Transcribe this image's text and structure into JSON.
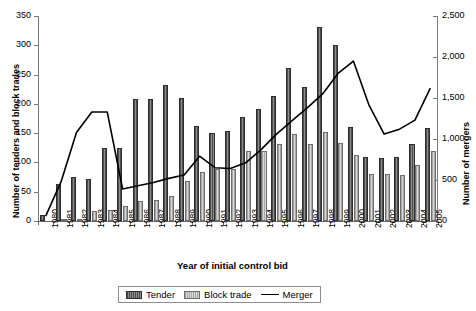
{
  "chart_data": {
    "type": "bar",
    "title": "",
    "xlabel": "Year of initial control bid",
    "ylabel": "Number of tenders and block trades",
    "ylabel_secondary": "Number of mergers",
    "ylim": [
      0,
      350
    ],
    "ylim_secondary": [
      0,
      2500
    ],
    "ytick_labels": [
      "0",
      "50",
      "100",
      "150",
      "200",
      "250",
      "300",
      "350"
    ],
    "ytick_values": [
      0,
      50,
      100,
      150,
      200,
      250,
      300,
      350
    ],
    "ytick_labels_secondary": [
      "0",
      "500",
      "1,000",
      "1,500",
      "2,000",
      "2,500"
    ],
    "ytick_values_secondary": [
      0,
      500,
      1000,
      1500,
      2000,
      2500
    ],
    "grid": false,
    "legend_position": "bottom",
    "categories": [
      "1980",
      "1981",
      "1982",
      "1983",
      "1984",
      "1985",
      "1986",
      "1987",
      "1988",
      "1989",
      "1990",
      "1991",
      "1992",
      "1993",
      "1994",
      "1995",
      "1996",
      "1997",
      "1998",
      "1999",
      "2000",
      "2001",
      "2002",
      "2003",
      "2004",
      "2005"
    ],
    "series": [
      {
        "name": "Tender",
        "axis": "left",
        "type": "bar",
        "values": [
          10,
          63,
          75,
          72,
          124,
          124,
          208,
          208,
          232,
          210,
          162,
          150,
          154,
          178,
          192,
          214,
          262,
          228,
          332,
          300,
          160,
          110,
          108,
          110,
          132,
          158
        ]
      },
      {
        "name": "Block trade",
        "axis": "left",
        "type": "bar",
        "values": [
          0,
          2,
          4,
          17,
          18,
          26,
          35,
          36,
          43,
          68,
          84,
          88,
          88,
          120,
          120,
          132,
          148,
          132,
          152,
          134,
          112,
          80,
          80,
          78,
          96,
          120
        ]
      },
      {
        "name": "Merger",
        "axis": "right",
        "type": "line",
        "values": [
          60,
          480,
          1080,
          1330,
          1330,
          390,
          430,
          470,
          520,
          560,
          790,
          650,
          640,
          710,
          870,
          1060,
          1220,
          1380,
          1550,
          1800,
          1950,
          1420,
          1060,
          1120,
          1230,
          1620
        ]
      }
    ]
  },
  "legend": {
    "items": [
      {
        "label": "Tender",
        "swatch": "bar-hatched-dark-swatch"
      },
      {
        "label": "Block trade",
        "swatch": "bar-hatched-light-swatch"
      },
      {
        "label": "Merger",
        "swatch": "line-swatch"
      }
    ]
  },
  "colors": {
    "tender": "#4e4e4e",
    "block_trade": "#a8a8a8",
    "merger_line": "#000000",
    "axis": "#7a7a7a",
    "background": "#ffffff"
  }
}
